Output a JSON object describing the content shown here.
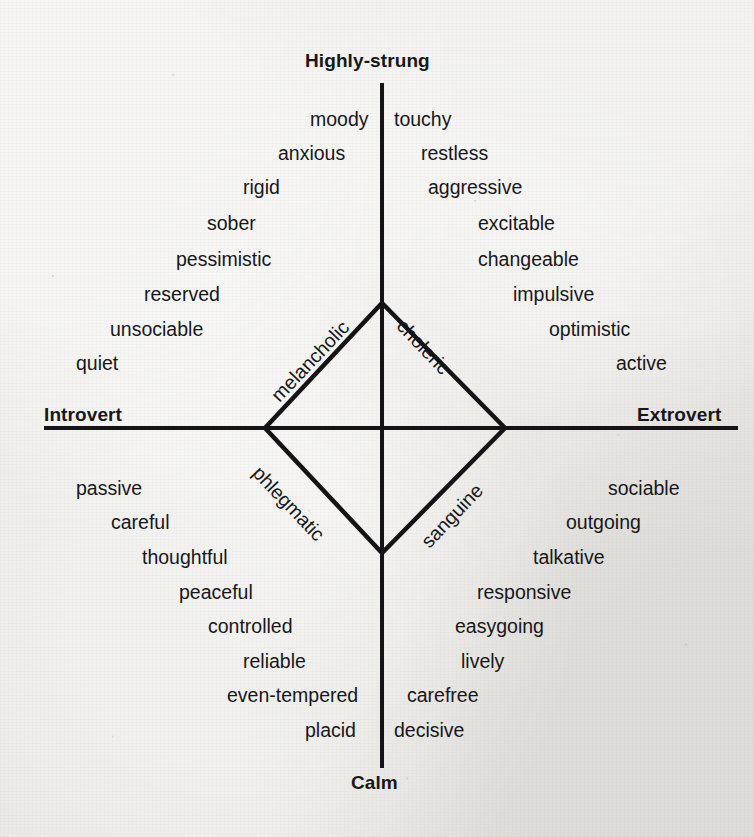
{
  "chart_data": {
    "type": "scatter",
    "title": "",
    "xlabel": "Introversion – Extroversion",
    "ylabel": "Stability – Instability",
    "axes": {
      "top_pole": "Highly-strung",
      "bottom_pole": "Calm",
      "left_pole": "Introvert",
      "right_pole": "Extrovert"
    },
    "temperaments": [
      {
        "name": "melancholic",
        "quadrant": "top-left"
      },
      {
        "name": "choleric",
        "quadrant": "top-right"
      },
      {
        "name": "phlegmatic",
        "quadrant": "bottom-left"
      },
      {
        "name": "sanguine",
        "quadrant": "bottom-right"
      }
    ],
    "quadrant_traits": {
      "melancholic": [
        "moody",
        "anxious",
        "rigid",
        "sober",
        "pessimistic",
        "reserved",
        "unsociable",
        "quiet"
      ],
      "choleric": [
        "touchy",
        "restless",
        "aggressive",
        "excitable",
        "changeable",
        "impulsive",
        "optimistic",
        "active"
      ],
      "phlegmatic": [
        "passive",
        "careful",
        "thoughtful",
        "peaceful",
        "controlled",
        "reliable",
        "even-tempered",
        "placid"
      ],
      "sanguine": [
        "sociable",
        "outgoing",
        "talkative",
        "responsive",
        "easygoing",
        "lively",
        "carefree",
        "decisive"
      ]
    },
    "grid": false,
    "legend": "none"
  },
  "poles": {
    "top": "Highly-strung",
    "bottom": "Calm",
    "left": "Introvert",
    "right": "Extrovert"
  },
  "temperaments": {
    "melancholic": "melancholic",
    "choleric": "choleric",
    "phlegmatic": "phlegmatic",
    "sanguine": "sanguine"
  },
  "quadrants": {
    "melancholic": [
      {
        "label": "moody",
        "x": 310,
        "y": 110
      },
      {
        "label": "anxious",
        "x": 278,
        "y": 144
      },
      {
        "label": "rigid",
        "x": 243,
        "y": 178
      },
      {
        "label": "sober",
        "x": 207,
        "y": 214
      },
      {
        "label": "pessimistic",
        "x": 176,
        "y": 250
      },
      {
        "label": "reserved",
        "x": 144,
        "y": 285
      },
      {
        "label": "unsociable",
        "x": 110,
        "y": 320
      },
      {
        "label": "quiet",
        "x": 76,
        "y": 354
      }
    ],
    "choleric": [
      {
        "label": "touchy",
        "x": 394,
        "y": 110
      },
      {
        "label": "restless",
        "x": 421,
        "y": 144
      },
      {
        "label": "aggressive",
        "x": 428,
        "y": 178
      },
      {
        "label": "excitable",
        "x": 478,
        "y": 214
      },
      {
        "label": "changeable",
        "x": 478,
        "y": 250
      },
      {
        "label": "impulsive",
        "x": 513,
        "y": 285
      },
      {
        "label": "optimistic",
        "x": 549,
        "y": 320
      },
      {
        "label": "active",
        "x": 616,
        "y": 354
      }
    ],
    "phlegmatic": [
      {
        "label": "passive",
        "x": 76,
        "y": 479
      },
      {
        "label": "careful",
        "x": 111,
        "y": 513
      },
      {
        "label": "thoughtful",
        "x": 142,
        "y": 548
      },
      {
        "label": "peaceful",
        "x": 179,
        "y": 583
      },
      {
        "label": "controlled",
        "x": 208,
        "y": 617
      },
      {
        "label": "reliable",
        "x": 243,
        "y": 652
      },
      {
        "label": "even-tempered",
        "x": 227,
        "y": 686
      },
      {
        "label": "placid",
        "x": 305,
        "y": 721
      }
    ],
    "sanguine": [
      {
        "label": "sociable",
        "x": 608,
        "y": 479
      },
      {
        "label": "outgoing",
        "x": 566,
        "y": 513
      },
      {
        "label": "talkative",
        "x": 533,
        "y": 548
      },
      {
        "label": "responsive",
        "x": 477,
        "y": 583
      },
      {
        "label": "easygoing",
        "x": 455,
        "y": 617
      },
      {
        "label": "lively",
        "x": 461,
        "y": 652
      },
      {
        "label": "carefree",
        "x": 407,
        "y": 686
      },
      {
        "label": "decisive",
        "x": 394,
        "y": 721
      }
    ]
  },
  "colors": {
    "ink": "#141417",
    "paper": "#e9e8e4"
  }
}
